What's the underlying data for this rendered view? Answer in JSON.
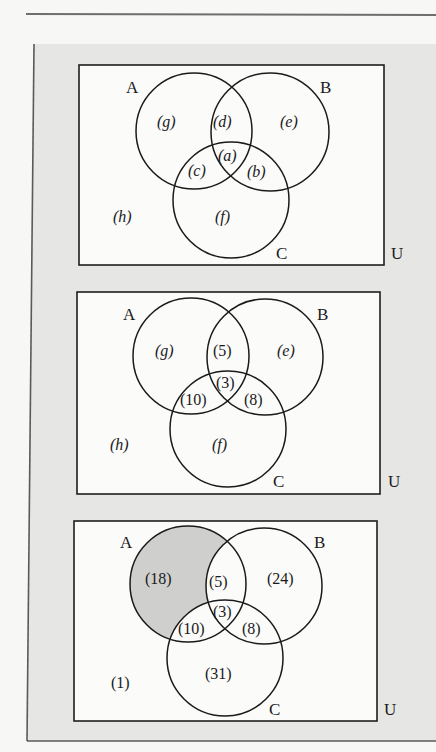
{
  "figure": {
    "set_labels": {
      "a": "A",
      "b": "B",
      "c": "C",
      "u": "U"
    },
    "shade_color": "#cfcfcd",
    "panels": [
      {
        "id": "panel-1-variables",
        "regions": {
          "a_only": "(g)",
          "b_only": "(e)",
          "c_only": "(f)",
          "ab_only": "(d)",
          "abc": "(a)",
          "ac_only": "(c)",
          "bc_only": "(b)",
          "outside": "(h)"
        },
        "italic_letters": true,
        "shaded_region": null
      },
      {
        "id": "panel-2-partial",
        "regions": {
          "a_only": "(g)",
          "b_only": "(e)",
          "c_only": "(f)",
          "ab_only": "(5)",
          "abc": "(3)",
          "ac_only": "(10)",
          "bc_only": "(8)",
          "outside": "(h)"
        },
        "shaded_region": null
      },
      {
        "id": "panel-3-complete",
        "regions": {
          "a_only": "(18)",
          "b_only": "(24)",
          "c_only": "(31)",
          "ab_only": "(5)",
          "abc": "(3)",
          "ac_only": "(10)",
          "bc_only": "(8)",
          "outside": "(1)"
        },
        "shaded_region": "a_only"
      }
    ]
  }
}
